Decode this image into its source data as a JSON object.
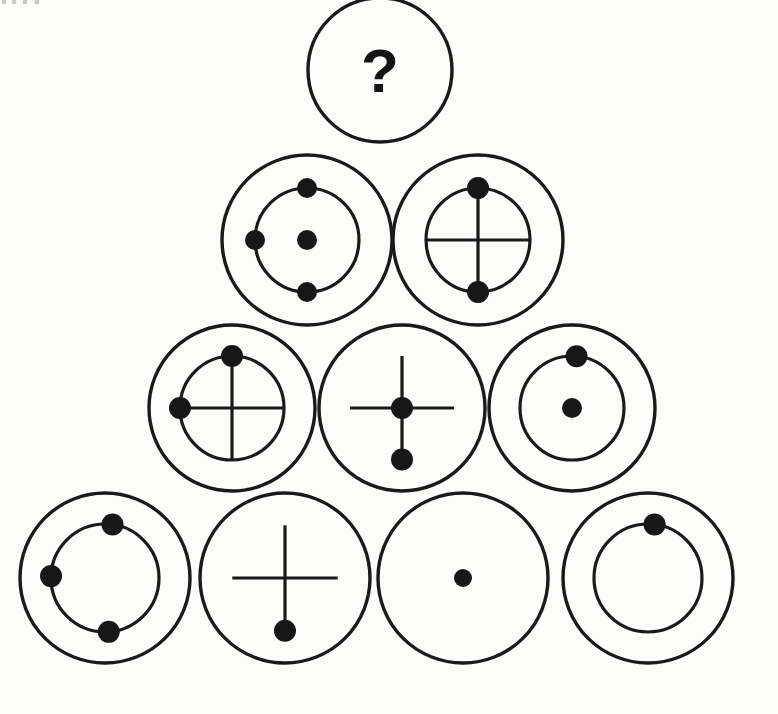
{
  "page": {
    "kind": "visual-logic-puzzle",
    "background_color": "#fcfcfb",
    "ink_color": "#1a1a1a",
    "dot_color": "#171717",
    "width": 778,
    "height": 714,
    "partial_text_top_left": ""
  },
  "legend": {
    "outer_ring": "outer-circle",
    "inner_ring": "inner-circle",
    "cross": "cross-lines",
    "center_dot": "center-dot",
    "node_dot": "orbit-dot",
    "question": "?"
  },
  "pyramid": {
    "row_count": 4,
    "rows": [
      {
        "index": 1,
        "label": "row-1-apex",
        "cells": [
          {
            "id": "r1c1",
            "label": "unknown-answer",
            "cx": 380,
            "cy": 70,
            "outer_r": 72,
            "has_outer": true,
            "has_inner": false,
            "inner_r": 0,
            "has_cross": false,
            "cross_extends": false,
            "has_center_dot": false,
            "dots": [],
            "question_mark": "?",
            "qmark_size": 62,
            "qmark_dx": 0,
            "qmark_dy": 22
          }
        ]
      },
      {
        "index": 2,
        "label": "row-2",
        "cells": [
          {
            "id": "r2c1",
            "label": "outer-inner-center-three-dots",
            "cx": 307,
            "cy": 240,
            "outer_r": 85,
            "has_outer": true,
            "has_inner": true,
            "inner_r": 52,
            "has_cross": false,
            "cross_extends": false,
            "has_center_dot": true,
            "center_r": 10,
            "dots": [
              {
                "angle": 270,
                "r": 10,
                "name": "orbit-dot-top"
              },
              {
                "angle": 180,
                "r": 10,
                "name": "orbit-dot-left"
              },
              {
                "angle": 90,
                "r": 10,
                "name": "orbit-dot-bottom"
              }
            ],
            "question_mark": null
          },
          {
            "id": "r2c2",
            "label": "outer-inner-cross-two-dots",
            "cx": 478,
            "cy": 240,
            "outer_r": 85,
            "has_outer": true,
            "has_inner": true,
            "inner_r": 52,
            "has_cross": true,
            "cross_extends": false,
            "has_center_dot": false,
            "center_r": 0,
            "dots": [
              {
                "angle": 270,
                "r": 11,
                "name": "orbit-dot-top"
              },
              {
                "angle": 90,
                "r": 11,
                "name": "orbit-dot-bottom"
              }
            ],
            "question_mark": null
          }
        ]
      },
      {
        "index": 3,
        "label": "row-3",
        "cells": [
          {
            "id": "r3c1",
            "label": "outer-inner-cross-two-dots-top-left",
            "cx": 232,
            "cy": 408,
            "outer_r": 83,
            "has_outer": true,
            "has_inner": true,
            "inner_r": 52,
            "has_cross": true,
            "cross_extends": false,
            "has_center_dot": false,
            "center_r": 0,
            "dots": [
              {
                "angle": 270,
                "r": 11,
                "name": "orbit-dot-top"
              },
              {
                "angle": 180,
                "r": 11,
                "name": "orbit-dot-left"
              }
            ],
            "question_mark": null
          },
          {
            "id": "r3c2",
            "label": "outer-cross-center-bottom-dot",
            "cx": 402,
            "cy": 408,
            "outer_r": 83,
            "has_outer": true,
            "has_inner": false,
            "inner_r": 52,
            "has_cross": true,
            "cross_extends": true,
            "has_center_dot": true,
            "center_r": 11,
            "dots": [
              {
                "angle": 90,
                "r": 11,
                "name": "orbit-dot-bottom"
              }
            ],
            "question_mark": null
          },
          {
            "id": "r3c3",
            "label": "outer-inner-center-one-dot-top",
            "cx": 572,
            "cy": 408,
            "outer_r": 83,
            "has_outer": true,
            "has_inner": true,
            "inner_r": 52,
            "has_cross": false,
            "cross_extends": false,
            "has_center_dot": true,
            "center_r": 10,
            "dots": [
              {
                "angle": 275,
                "r": 11,
                "name": "orbit-dot-top"
              }
            ],
            "question_mark": null
          }
        ]
      },
      {
        "index": 4,
        "label": "row-4-base",
        "cells": [
          {
            "id": "r4c1",
            "label": "outer-inner-three-dots",
            "cx": 105,
            "cy": 578,
            "outer_r": 85,
            "has_outer": true,
            "has_inner": true,
            "inner_r": 54,
            "has_cross": false,
            "cross_extends": false,
            "has_center_dot": false,
            "center_r": 0,
            "dots": [
              {
                "angle": 278,
                "r": 11,
                "name": "orbit-dot-top"
              },
              {
                "angle": 182,
                "r": 11,
                "name": "orbit-dot-left"
              },
              {
                "angle": 86,
                "r": 11,
                "name": "orbit-dot-bottom"
              }
            ],
            "question_mark": null
          },
          {
            "id": "r4c2",
            "label": "outer-cross-bottom-dot",
            "cx": 285,
            "cy": 578,
            "outer_r": 85,
            "has_outer": true,
            "has_inner": false,
            "inner_r": 0,
            "has_cross": true,
            "cross_extends": true,
            "has_center_dot": false,
            "center_r": 0,
            "dots": [
              {
                "angle": 90,
                "r": 11,
                "name": "orbit-dot-bottom"
              }
            ],
            "question_mark": null
          },
          {
            "id": "r4c3",
            "label": "outer-center-dot-only",
            "cx": 463,
            "cy": 578,
            "outer_r": 85,
            "has_outer": true,
            "has_inner": false,
            "inner_r": 0,
            "has_cross": false,
            "cross_extends": false,
            "has_center_dot": true,
            "center_r": 9,
            "dots": [],
            "question_mark": null
          },
          {
            "id": "r4c4",
            "label": "outer-inner-one-dot-top",
            "cx": 648,
            "cy": 578,
            "outer_r": 85,
            "has_outer": true,
            "has_inner": true,
            "inner_r": 54,
            "has_cross": false,
            "cross_extends": false,
            "has_center_dot": false,
            "center_r": 0,
            "dots": [
              {
                "angle": 277,
                "r": 11,
                "name": "orbit-dot-top"
              }
            ],
            "question_mark": null
          }
        ]
      }
    ]
  }
}
